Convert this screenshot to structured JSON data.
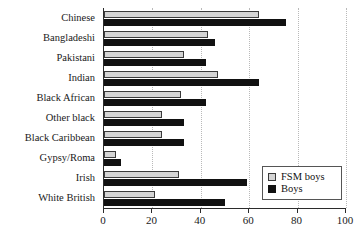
{
  "chart_data": {
    "type": "bar",
    "orientation": "horizontal",
    "title": "",
    "subtitle": "",
    "xlabel": "",
    "ylabel": "",
    "xlim": [
      0,
      100
    ],
    "xticks": [
      0,
      20,
      40,
      60,
      80,
      100
    ],
    "xtick_labels": [
      "0",
      "20",
      "40",
      "60",
      "80",
      "100"
    ],
    "grid": true,
    "grid_axis": "x",
    "legend_position": "bottom-right",
    "categories": [
      "Chinese",
      "Bangladeshi",
      "Pakistani",
      "Indian",
      "Black African",
      "Other black",
      "Black Caribbean",
      "Gypsy/Roma",
      "Irish",
      "White British"
    ],
    "series": [
      {
        "name": "FSM boys",
        "color": "#d4d4d4",
        "values": [
          64,
          43,
          33,
          47,
          32,
          24,
          24,
          5,
          31,
          21
        ]
      },
      {
        "name": "Boys",
        "color": "#111111",
        "values": [
          75,
          46,
          42,
          64,
          42,
          33,
          33,
          7,
          59,
          50
        ]
      }
    ]
  },
  "legend": {
    "items": [
      {
        "label": "FSM boys",
        "swatch": "light-gray-square"
      },
      {
        "label": "Boys",
        "swatch": "black-square"
      }
    ]
  },
  "axis": {
    "x_min": 0,
    "x_max": 100,
    "x_step": 20
  }
}
